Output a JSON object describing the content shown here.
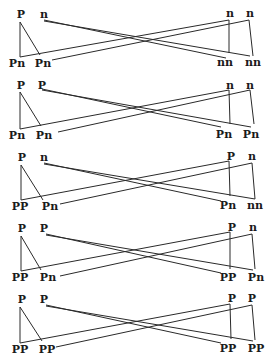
{
  "diagram": {
    "type": "genetic-cross-recombination",
    "crosses": [
      {
        "parent_left": {
          "allele_a": "P",
          "allele_b": "n"
        },
        "parent_right": {
          "allele_a": "n",
          "allele_b": "n"
        },
        "offspring_left": [
          "Pn",
          "Pn"
        ],
        "offspring_right": [
          "nn",
          "nn"
        ]
      },
      {
        "parent_left": {
          "allele_a": "P",
          "allele_b": "P"
        },
        "parent_right": {
          "allele_a": "n",
          "allele_b": "n"
        },
        "offspring_left": [
          "Pn",
          "Pn"
        ],
        "offspring_right": [
          "Pn",
          "Pn"
        ]
      },
      {
        "parent_left": {
          "allele_a": "P",
          "allele_b": "n"
        },
        "parent_right": {
          "allele_a": "P",
          "allele_b": "n"
        },
        "offspring_left": [
          "PP",
          "Pn"
        ],
        "offspring_right": [
          "Pn",
          "nn"
        ]
      },
      {
        "parent_left": {
          "allele_a": "P",
          "allele_b": "P"
        },
        "parent_right": {
          "allele_a": "P",
          "allele_b": "n"
        },
        "offspring_left": [
          "PP",
          "Pn"
        ],
        "offspring_right": [
          "PP",
          "Pn"
        ]
      },
      {
        "parent_left": {
          "allele_a": "P",
          "allele_b": "P"
        },
        "parent_right": {
          "allele_a": "P",
          "allele_b": "P"
        },
        "offspring_left": [
          "PP",
          "PP"
        ],
        "offspring_right": [
          "PP",
          "PP"
        ]
      }
    ]
  }
}
